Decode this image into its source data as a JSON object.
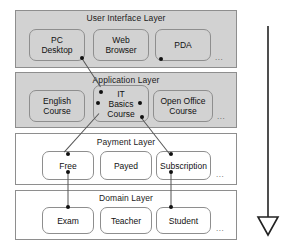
{
  "diagram": {
    "arrow": {
      "name": "downward-direction-arrow",
      "direction": "down",
      "color": "#222222"
    },
    "ellipsis_label": "...",
    "layers": [
      {
        "id": "user-interface-layer",
        "title": "User Interface Layer",
        "shaded": true,
        "nodes": [
          {
            "id": "pc-desktop",
            "label": "PC\nDesktop"
          },
          {
            "id": "web-browser",
            "label": "Web\nBrowser"
          },
          {
            "id": "pda",
            "label": "PDA"
          }
        ]
      },
      {
        "id": "application-layer",
        "title": "Application Layer",
        "shaded": true,
        "nodes": [
          {
            "id": "english-course",
            "label": "English\nCourse"
          },
          {
            "id": "it-basics-course",
            "label": "IT\nBasics\nCourse"
          },
          {
            "id": "open-office-course",
            "label": "Open Office\nCourse"
          }
        ]
      },
      {
        "id": "payment-layer",
        "title": "Payment Layer",
        "shaded": false,
        "nodes": [
          {
            "id": "free",
            "label": "Free"
          },
          {
            "id": "payed",
            "label": "Payed"
          },
          {
            "id": "subscription",
            "label": "Subscription"
          }
        ]
      },
      {
        "id": "domain-layer",
        "title": "Domain Layer",
        "shaded": false,
        "nodes": [
          {
            "id": "exam",
            "label": "Exam"
          },
          {
            "id": "teacher",
            "label": "Teacher"
          },
          {
            "id": "student",
            "label": "Student"
          }
        ]
      }
    ]
  }
}
